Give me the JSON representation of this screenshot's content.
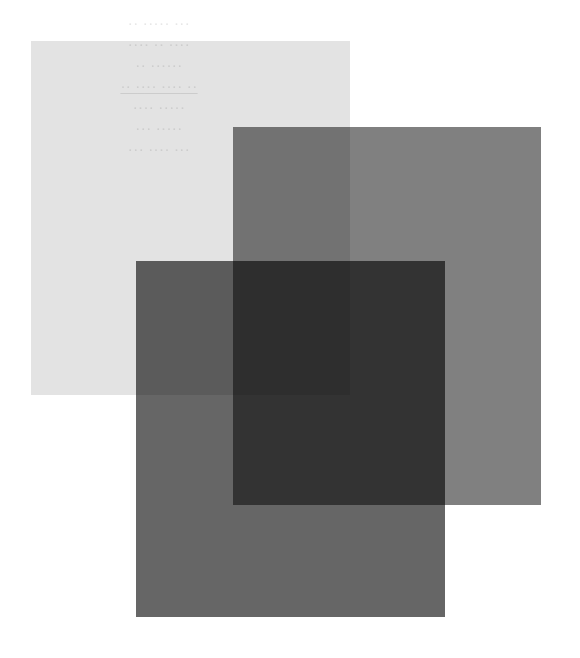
{
  "canvas": {
    "width": 580,
    "height": 658,
    "background_color": "#ffffff",
    "description": "Three overlapping translucent gray rectangles on a white background"
  },
  "panels": [
    {
      "id": "light",
      "label": "Light translucent rectangle",
      "fill_color": "#e3e3e3",
      "x": 31,
      "y": 41,
      "width": 319,
      "height": 354,
      "blend_mode": "multiply",
      "z_order": 1
    },
    {
      "id": "medium",
      "label": "Medium gray translucent rectangle",
      "fill_color": "#808080",
      "x": 233,
      "y": 127,
      "width": 308,
      "height": 378,
      "blend_mode": "multiply",
      "z_order": 2
    },
    {
      "id": "dark",
      "label": "Dark gray translucent rectangle",
      "fill_color": "#666666",
      "x": 136,
      "y": 261,
      "width": 309,
      "height": 356,
      "blend_mode": "multiply",
      "z_order": 3
    }
  ],
  "overlap_tones": {
    "light_only": "#e3e3e3",
    "medium_only": "#808080",
    "dark_only": "#666666",
    "light_plus_medium": "#6e6e6e",
    "light_plus_dark": "#575757",
    "medium_plus_dark": "#1a1a1a",
    "all_three": "#000000"
  },
  "watermark": {
    "visible": true,
    "color": "#d2d2d2",
    "note": "Barely legible ghost text showing through the lightest panel",
    "lines": [
      "·· ····· ···",
      "···· ·· ····",
      "·· ······",
      "·· ···· ···· ··",
      "···· ·····",
      "··· ·····",
      "··· ···· ···"
    ]
  },
  "grain": {
    "enabled": true,
    "opacity": 0.085,
    "description": "Fine film-grain noise texture across the whole image"
  }
}
